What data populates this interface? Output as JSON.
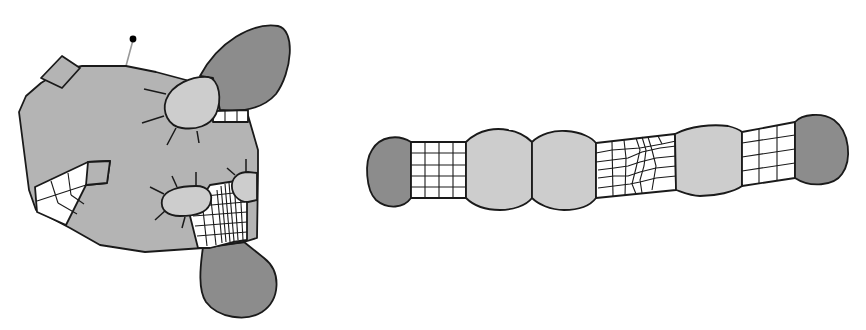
{
  "figure": {
    "description": "Two mesh-decomposition diagrams: left, a large irregular grey region with attached dark lobes, light-grey sub-regions with spoke lines, and white structured quad meshes; right, a horizontal chain of regions with dark end caps, light bulges, and white quad meshes.",
    "colors": {
      "background": "#ffffff",
      "main_region": "#b4b4b4",
      "dark_lobe": "#8c8c8c",
      "light_region": "#cdcdcd",
      "mesh": "#ffffff",
      "outline": "#1a1a1a",
      "pin": "#000000",
      "pin_stem": "#999999"
    }
  },
  "left_diagram": {
    "name": "irregular-domain-with-lobes",
    "parts": [
      "main-grey-region",
      "small-square-notch",
      "pin-marker",
      "top-right-dark-lobe",
      "upper-light-subregion",
      "top-mesh-strip",
      "left-notch-mesh",
      "lower-light-subregion-left",
      "lower-light-subregion-right",
      "lower-dense-mesh",
      "bottom-dark-lobe"
    ]
  },
  "right_diagram": {
    "name": "chain-of-regions",
    "segments": [
      "left-dark-cap",
      "regular-grid-mesh",
      "light-bulge-1",
      "light-bulge-2",
      "irregular-mesh",
      "light-bulge-3",
      "skewed-grid-mesh",
      "right-dark-cap"
    ]
  }
}
